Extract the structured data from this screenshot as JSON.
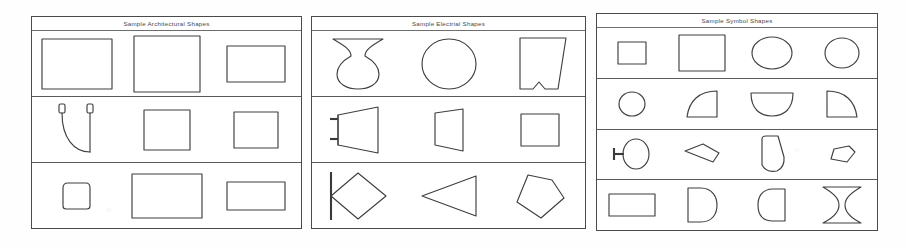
{
  "document": {
    "kind": "scanned-shape-library-sheet",
    "panel_count": 3
  },
  "panels": [
    {
      "id": "architectural",
      "title": "Sample Architectural Shapes",
      "rows": [
        {
          "cells": [
            {
              "name": "rectangle-large",
              "shape": "rect"
            },
            {
              "name": "rectangle-tall",
              "shape": "rect"
            },
            {
              "name": "rectangle-small",
              "shape": "rect"
            }
          ]
        },
        {
          "cells": [
            {
              "name": "door-swing-arc",
              "shape": "door-swing"
            },
            {
              "name": "square-medium",
              "shape": "rect"
            },
            {
              "name": "square-small",
              "shape": "rect"
            }
          ]
        },
        {
          "cells": [
            {
              "name": "notched-rectangle",
              "shape": "notched-rect"
            },
            {
              "name": "rectangle-wide",
              "shape": "rect"
            },
            {
              "name": "rectangle-flat",
              "shape": "rect"
            }
          ]
        }
      ]
    },
    {
      "id": "electrical",
      "title": "Sample Electrial Shapes",
      "rows": [
        {
          "cells": [
            {
              "name": "bowtie-over-ellipse",
              "shape": "bowtie-ellipse"
            },
            {
              "name": "ellipse",
              "shape": "ellipse"
            },
            {
              "name": "notched-trapezoid",
              "shape": "notched-trapezoid"
            }
          ]
        },
        {
          "cells": [
            {
              "name": "horn-with-leads",
              "shape": "horn"
            },
            {
              "name": "trapezoid",
              "shape": "trapezoid"
            },
            {
              "name": "square",
              "shape": "rect"
            }
          ]
        },
        {
          "cells": [
            {
              "name": "diamond-with-bar",
              "shape": "diamond-bar"
            },
            {
              "name": "triangle-left",
              "shape": "triangle-left"
            },
            {
              "name": "pentagon-kite",
              "shape": "pentagon-kite"
            }
          ]
        }
      ]
    },
    {
      "id": "symbol",
      "title": "Sample Symbol Shapes",
      "rows": [
        {
          "cells": [
            {
              "name": "square-small",
              "shape": "rect"
            },
            {
              "name": "square-large",
              "shape": "rect"
            },
            {
              "name": "ellipse-wide",
              "shape": "ellipse"
            },
            {
              "name": "ellipse-round",
              "shape": "ellipse"
            }
          ]
        },
        {
          "cells": [
            {
              "name": "circle-small",
              "shape": "circle"
            },
            {
              "name": "quarter-round-left",
              "shape": "quarter-round-l"
            },
            {
              "name": "half-circle-down",
              "shape": "half-circle"
            },
            {
              "name": "quarter-round-right",
              "shape": "quarter-round-r"
            }
          ]
        },
        {
          "cells": [
            {
              "name": "ellipse-with-stem",
              "shape": "ellipse-stem"
            },
            {
              "name": "wedge-kite",
              "shape": "wedge"
            },
            {
              "name": "rounded-wedge",
              "shape": "rounded-wedge"
            },
            {
              "name": "small-blob",
              "shape": "blob"
            }
          ]
        },
        {
          "cells": [
            {
              "name": "rectangle",
              "shape": "rect"
            },
            {
              "name": "d-shape-right",
              "shape": "d-right"
            },
            {
              "name": "d-shape-left",
              "shape": "d-left"
            },
            {
              "name": "hourglass",
              "shape": "hourglass"
            }
          ]
        }
      ]
    }
  ],
  "colors": {
    "page": "#ffffff",
    "ink": "#3f3f3f",
    "border": "#4a4a4a"
  }
}
